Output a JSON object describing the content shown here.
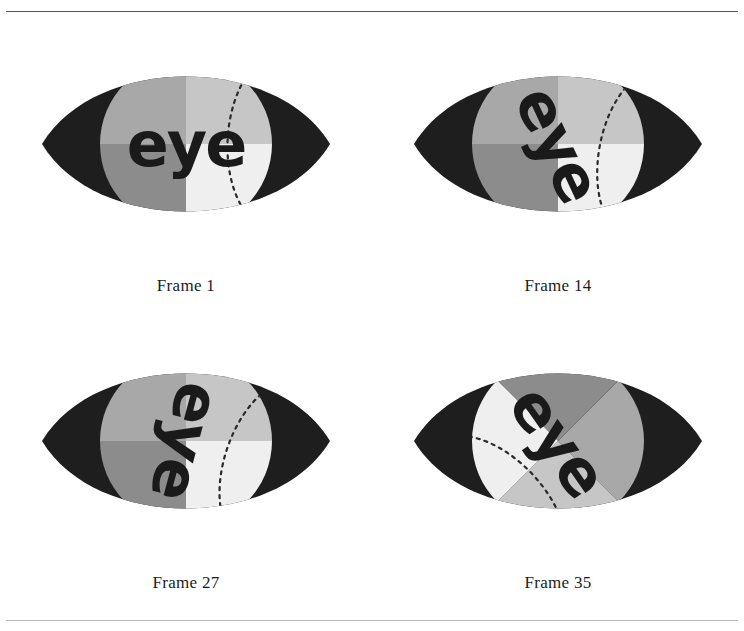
{
  "page": {
    "width": 744,
    "height": 631,
    "background": "#ffffff",
    "rule_color": "#555555",
    "rule_color_bottom": "#b9b9b9"
  },
  "palette": {
    "eyelid": "#1e1e1e",
    "iris_upper_left": "#a8a8a8",
    "iris_upper_right": "#c6c6c6",
    "iris_lower_left": "#8c8c8c",
    "iris_lower_right": "#efefef",
    "word_color": "#1a1a1a",
    "dotted_arc": "#2a2a2a",
    "caption_color": "#1c1c1c"
  },
  "figure_geometry": {
    "iris_center_x": 150,
    "iris_center_y": 112,
    "iris_radius": 86,
    "eye_left_point_x": 6,
    "eye_right_point_x": 294,
    "eye_mid_y": 112
  },
  "frames": [
    {
      "id": "frame-1",
      "caption": "Frame 1",
      "word": "eye",
      "word_rotation_deg": 0,
      "iris_rotation_deg": 0,
      "word_font_size": 62,
      "arc_rotation_deg": 0
    },
    {
      "id": "frame-14",
      "caption": "Frame 14",
      "word": "eye",
      "word_rotation_deg": 65,
      "iris_rotation_deg": 0,
      "word_font_size": 46,
      "arc_rotation_deg": 8
    },
    {
      "id": "frame-27",
      "caption": "Frame 27",
      "word": "eye",
      "word_rotation_deg": 105,
      "iris_rotation_deg": 0,
      "word_font_size": 62,
      "arc_rotation_deg": 16
    },
    {
      "id": "frame-35",
      "caption": "Frame 35",
      "word": "eye",
      "word_rotation_deg": 55,
      "iris_rotation_deg": 135,
      "word_font_size": 62,
      "arc_rotation_deg": 134
    }
  ]
}
